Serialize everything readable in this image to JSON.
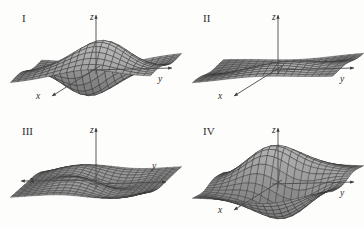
{
  "figure": {
    "background_color": "#fdfdfc",
    "ink_color": "#2b2b2b",
    "mesh_color": "#3d3d3d",
    "panel_count": 4
  },
  "faint_bleedthrough": {
    "line1": "                    ",
    "line2": "                    "
  },
  "panels": [
    {
      "id": "panel-I",
      "label": "I",
      "label_x": 22,
      "label_y": 22,
      "origin_x": 96,
      "origin_y": 68,
      "axes": {
        "z": {
          "label": "z",
          "label_x": 90,
          "label_y": 20,
          "tip_x": 96,
          "tip_y": 15
        },
        "y": {
          "label": "y",
          "label_x": 158,
          "label_y": 82,
          "tip_x": 172,
          "tip_y": 68
        },
        "x": {
          "label": "x",
          "label_x": 36,
          "label_y": 99,
          "tip_x": 52,
          "tip_y": 96
        }
      },
      "surface": {
        "kind": "two-peaks-two-valleys",
        "description": "z = x*exp(-x^2-y^2) style double bump with adjacent wells; two raised crests and two depressions",
        "amp": 30,
        "rot": 0.0,
        "sign": 1
      }
    },
    {
      "id": "panel-II",
      "label": "II",
      "label_x": 203,
      "label_y": 22,
      "origin_x": 278,
      "origin_y": 68,
      "axes": {
        "z": {
          "label": "z",
          "label_x": 272,
          "label_y": 20,
          "tip_x": 278,
          "tip_y": 15
        },
        "y": {
          "label": "y",
          "label_x": 340,
          "label_y": 82,
          "tip_x": 354,
          "tip_y": 68
        },
        "x": {
          "label": "x",
          "label_x": 218,
          "label_y": 99,
          "tip_x": 234,
          "tip_y": 96
        }
      },
      "surface": {
        "kind": "gentle-single-ripple",
        "description": "shallow monkey-saddle / single ripple, low amplitude, mostly flat at edges",
        "amp": 14,
        "rot": 0.0,
        "sign": 1
      }
    },
    {
      "id": "panel-III",
      "label": "III",
      "label_x": 22,
      "label_y": 135,
      "origin_x": 96,
      "origin_y": 182,
      "axes": {
        "z": {
          "label": "z",
          "label_x": 90,
          "label_y": 133,
          "tip_x": 96,
          "tip_y": 128
        },
        "y": {
          "label": "y",
          "label_x": 152,
          "label_y": 169,
          "tip_x": 166,
          "tip_y": 182
        },
        "x": {
          "label": "x",
          "label_x": 30,
          "label_y": 183,
          "tip_x": 21,
          "tip_y": 181
        }
      },
      "surface": {
        "kind": "saddle-ridge",
        "description": "broad saddle: high ridge at back-left falling to deep trough at front-right",
        "amp": 24,
        "rot": 0.0,
        "sign": -1
      }
    },
    {
      "id": "panel-IV",
      "label": "IV",
      "label_x": 203,
      "label_y": 135,
      "origin_x": 278,
      "origin_y": 182,
      "axes": {
        "z": {
          "label": "z",
          "label_x": 272,
          "label_y": 133,
          "tip_x": 278,
          "tip_y": 128
        },
        "y": {
          "label": "y",
          "label_x": 340,
          "label_y": 196,
          "tip_x": 354,
          "tip_y": 182
        },
        "x": {
          "label": "x",
          "label_x": 218,
          "label_y": 213,
          "tip_x": 234,
          "tip_y": 210
        }
      },
      "surface": {
        "kind": "two-peaks-two-valleys-mirrored",
        "description": "mirror image of panel I: two crests and two wells, peaks toward the left/back",
        "amp": 30,
        "rot": 3.14159,
        "sign": 1
      }
    }
  ]
}
